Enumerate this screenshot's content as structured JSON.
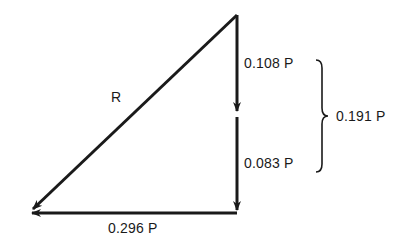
{
  "diagram": {
    "type": "vector force polygon",
    "vectors": [
      {
        "id": "upper-vertical",
        "label": "0.108 P",
        "from": [
          237,
          15
        ],
        "to": [
          237,
          112
        ]
      },
      {
        "id": "lower-vertical",
        "label": "0.083 P",
        "from": [
          237,
          117
        ],
        "to": [
          237,
          212
        ]
      },
      {
        "id": "horizontal",
        "label": "0.296 P",
        "from": [
          237,
          212
        ],
        "to": [
          30,
          212
        ]
      },
      {
        "id": "resultant",
        "label": "R",
        "from": [
          237,
          15
        ],
        "to": [
          30,
          212
        ]
      }
    ],
    "brace": {
      "label": "0.191 P"
    },
    "stroke_color": "#1a1a1a"
  }
}
